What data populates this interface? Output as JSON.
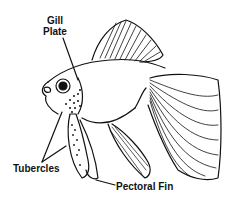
{
  "diagram": {
    "labels": {
      "gill_plate_line1": "Gill",
      "gill_plate_line2": "Plate",
      "tubercles": "Tubercles",
      "pectoral_fin": "Pectoral Fin"
    },
    "colors": {
      "ink": "#111111",
      "background": "#ffffff"
    }
  }
}
